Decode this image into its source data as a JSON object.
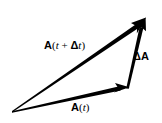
{
  "figure": {
    "name": "vector-increment-triangle",
    "background_color": "#ffffff",
    "stroke_color": "#000000",
    "labels": {
      "a_t_plus_delta_t": {
        "vector_symbol": "A",
        "open_paren": "(",
        "t_first": "t",
        "plus": " + ",
        "delta": "Δ",
        "t_second": "t",
        "close_paren": ")",
        "full_text": "A(t + Δt)"
      },
      "delta_a": {
        "delta": "Δ",
        "vector_symbol": "A",
        "full_text": "ΔA"
      },
      "a_t": {
        "vector_symbol": "A",
        "open_paren": "(",
        "t": "t",
        "close_paren": ")",
        "full_text": "A(t)"
      }
    },
    "geometry": {
      "origin": {
        "x": 12,
        "y": 112
      },
      "apex": {
        "x": 145,
        "y": 19
      },
      "a_t_head": {
        "x": 128,
        "y": 87
      }
    }
  }
}
